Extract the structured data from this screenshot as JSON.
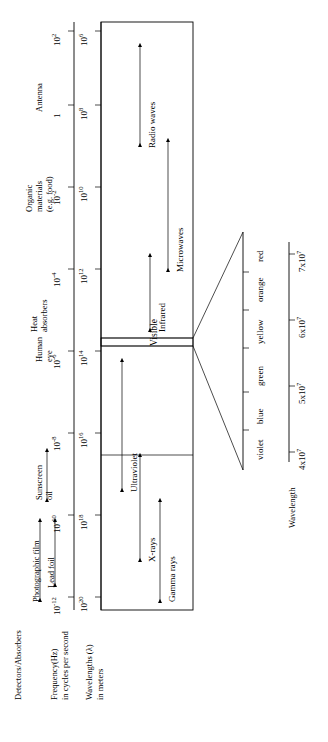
{
  "figure": {
    "type": "electromagnetic-spectrum-diagram",
    "orientation": "rotated-90-ccw",
    "row_titles": {
      "detectors": "Detectors/Absorbers",
      "frequency": "Frequency(Hz)",
      "frequency_sub": "in cycles per second",
      "wavelength": "Wavelengths (λ)",
      "wavelength_sub": "in meters"
    },
    "frequency_axis": {
      "label": "Frequency(Hz)",
      "ticks": [
        "10",
        "10",
        "10",
        "10",
        "10",
        "10",
        "10",
        "10",
        "10",
        "10"
      ],
      "tick_bases": [
        "10",
        "10",
        "10",
        "10",
        "10",
        "10",
        "10",
        "10",
        "10",
        "10"
      ],
      "tick_exponents": [
        "20",
        "18",
        "16",
        "14",
        "12",
        "10",
        "8",
        "6"
      ],
      "tick_labels": [
        "10^20",
        "10^18",
        "10^16",
        "10^14",
        "10^12",
        "10^10",
        "10^8",
        "10^6"
      ]
    },
    "wavelength_axis": {
      "label": "Wavelengths (λ)",
      "tick_labels": [
        "10^-12",
        "10^-10",
        "10^-8",
        "10^-6",
        "10^-4",
        "10^-2",
        "1",
        "10^2"
      ],
      "tick_bases": [
        "10",
        "10",
        "10",
        "10",
        "10",
        "10",
        "1",
        "10"
      ],
      "tick_exponents": [
        "-12",
        "-10",
        "-8",
        "-6",
        "-4",
        "-2",
        "",
        "2"
      ]
    },
    "bands": [
      {
        "name": "Gamma rays",
        "label": "Gamma rays"
      },
      {
        "name": "X-rays",
        "label": "X-rays"
      },
      {
        "name": "Ultraviolet",
        "label": "Ultraviolet"
      },
      {
        "name": "Visible",
        "label": "Visible"
      },
      {
        "name": "Infrared",
        "label": "Infrared"
      },
      {
        "name": "Microwaves",
        "label": "Microwaves"
      },
      {
        "name": "Radio waves",
        "label": "Radio waves"
      }
    ],
    "detectors": [
      {
        "label": "Photographic film"
      },
      {
        "label": "Lead foil"
      },
      {
        "label": "Sunscreen oil",
        "line1": "Sunscreen",
        "line2": "oil"
      },
      {
        "label": "Human eye",
        "line1": "Human",
        "line2": "eye"
      },
      {
        "label": "Heat absorbers (e.g. skin)",
        "line1": "Heat",
        "line2": "absorbers"
      },
      {
        "label": "Organic materials (e.g. food)",
        "line1": "Organic",
        "line2": "materials",
        "line3": "(e.g. food)"
      },
      {
        "label": "Antenna"
      }
    ],
    "visible_detail": {
      "label": "Visible",
      "axis_label": "Wavelength",
      "colors": [
        {
          "name": "violet",
          "label": "violet"
        },
        {
          "name": "blue",
          "label": "blue"
        },
        {
          "name": "green",
          "label": "green"
        },
        {
          "name": "yellow",
          "label": "yellow"
        },
        {
          "name": "orange",
          "label": "orange"
        },
        {
          "name": "red",
          "label": "red"
        }
      ],
      "ticks": [
        {
          "label": "4x10^7",
          "mantissa": "4x10",
          "exponent": "7"
        },
        {
          "label": "5x10^7",
          "mantissa": "5x10",
          "exponent": "7"
        },
        {
          "label": "6x10^7",
          "mantissa": "6x10",
          "exponent": "7"
        },
        {
          "label": "7x10^7",
          "mantissa": "7x10",
          "exponent": "7"
        }
      ]
    }
  }
}
